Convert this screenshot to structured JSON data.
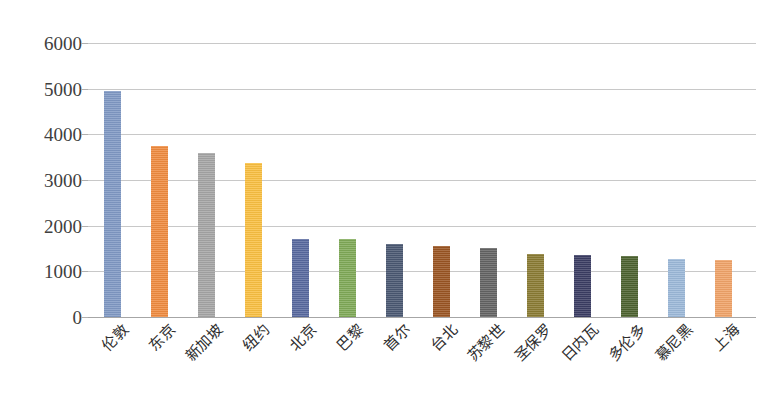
{
  "chart_data": {
    "type": "bar",
    "title": "",
    "subtitle": "",
    "xlabel": "",
    "ylabel": "",
    "ylim": [
      0,
      6000
    ],
    "ytick_labels": [
      "0",
      "1000",
      "2000",
      "3000",
      "4000",
      "5000",
      "6000"
    ],
    "ytick_values": [
      0,
      1000,
      2000,
      3000,
      4000,
      5000,
      6000
    ],
    "grid": true,
    "legend": "none",
    "categories": [
      "伦敦",
      "东京",
      "新加坡",
      "纽约",
      "北京",
      "巴黎",
      "首尔",
      "台北",
      "苏黎世",
      "圣保罗",
      "日内瓦",
      "多伦多",
      "慕尼黑",
      "上海"
    ],
    "values": [
      4950,
      3740,
      3600,
      3380,
      1700,
      1700,
      1600,
      1550,
      1520,
      1380,
      1360,
      1330,
      1280,
      1250
    ],
    "bar_colors": [
      "#8099c4",
      "#ef8b3f",
      "#a5a5a5",
      "#f9bf41",
      "#58699f",
      "#7fa957",
      "#4a5872",
      "#9a5522",
      "#636363",
      "#8a7b33",
      "#3b3d63",
      "#4c622f",
      "#9cb9d9",
      "#f0a368"
    ],
    "grid_color": "#c8c8c8",
    "axis_color": "#a6a6a6",
    "background": "#ffffff"
  }
}
